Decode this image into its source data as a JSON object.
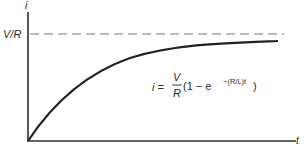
{
  "diagram": {
    "y_axis_label": "i",
    "x_axis_label": "t",
    "asymptote_label": "V/R",
    "equation": {
      "lhs": "i =",
      "frac_num": "V",
      "frac_den": "R",
      "rest_prefix": "(1 − e",
      "exponent": "−(R/L)t",
      "rest_suffix": ")"
    },
    "colors": {
      "axis": "#555555",
      "curve": "#222222",
      "asymptote": "#666666",
      "text": "#2a2a2a"
    }
  }
}
